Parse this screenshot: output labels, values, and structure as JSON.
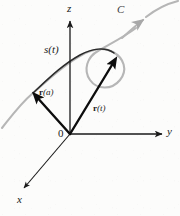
{
  "figure": {
    "background_color": "#fcfcfb",
    "width": 180,
    "height": 216
  },
  "colors": {
    "axis": "#1a1a1a",
    "vector": "#0d0d0d",
    "arc_dark": "#2b2b2b",
    "curve_gray": "#b3b3b3",
    "label": "#1a1a1a"
  },
  "axes": {
    "z": {
      "label": "z",
      "direction": "up",
      "origin": [
        70,
        134
      ],
      "tip": [
        70,
        20
      ],
      "label_pos": [
        67,
        4
      ]
    },
    "y": {
      "label": "y",
      "direction": "right",
      "origin": [
        70,
        134
      ],
      "tip": [
        166,
        134
      ],
      "label_pos": [
        168,
        128
      ]
    },
    "x": {
      "label": "x",
      "direction": "down-left",
      "origin": [
        70,
        134
      ],
      "tip": [
        21,
        191
      ],
      "label_pos": [
        18,
        196
      ]
    }
  },
  "origin": {
    "label": "0",
    "pos": [
      70,
      134
    ],
    "label_pos": [
      59,
      128
    ]
  },
  "curve": {
    "label": "C",
    "label_pos": [
      118,
      6
    ],
    "color": "#b3b3b3",
    "description": "light gray space curve with a loop, arrowhead pointing up-right near top right",
    "arrow_tip": [
      143,
      18
    ]
  },
  "arc": {
    "label": "s(t)",
    "label_pos": [
      44,
      45
    ],
    "color": "#2b2b2b",
    "description": "darker traced arc from the tip of r(a) to the tip of r(t), representing arc length s(t)"
  },
  "vectors": [
    {
      "name": "r-of-a",
      "label_r": "r",
      "label_arg": "(a)",
      "label": "r(a)",
      "from": [
        70,
        134
      ],
      "to": [
        32,
        92
      ],
      "label_pos": [
        39,
        93
      ]
    },
    {
      "name": "r-of-t",
      "label_r": "r",
      "label_arg": "(t)",
      "label": "r(t)",
      "from": [
        70,
        134
      ],
      "to": [
        118,
        56
      ],
      "label_pos": [
        94,
        108
      ]
    }
  ]
}
